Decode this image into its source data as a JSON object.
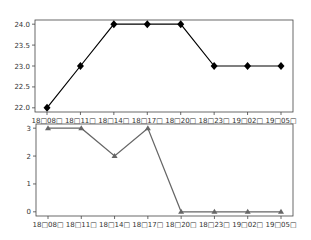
{
  "chart_data": [
    {
      "type": "line",
      "title": "",
      "xlabel": "",
      "ylabel": "",
      "categories": [
        "18□08□",
        "18□11□",
        "18□14□",
        "18□17□",
        "18□20□",
        "18□23□",
        "19□02□",
        "19□05□"
      ],
      "series": [
        {
          "name": "series-1",
          "values": [
            22,
            23,
            24,
            24,
            24,
            23,
            23,
            23
          ],
          "color": "#000000",
          "marker": "diamond"
        }
      ],
      "yticks": [
        "22.0",
        "22.5",
        "23.0",
        "23.5",
        "24.0"
      ],
      "ylim": [
        21.9,
        24.1
      ],
      "grid": false,
      "legend": null
    },
    {
      "type": "line",
      "title": "",
      "xlabel": "",
      "ylabel": "",
      "categories": [
        "18□08□",
        "18□11□",
        "18□14□",
        "18□17□",
        "18□20□",
        "18□23□",
        "19□02□",
        "19□05□"
      ],
      "series": [
        {
          "name": "series-2",
          "values": [
            3,
            3,
            2,
            3,
            0,
            0,
            0,
            0
          ],
          "color": "#666666",
          "marker": "triangle"
        }
      ],
      "yticks": [
        "0",
        "1",
        "2",
        "3"
      ],
      "ylim": [
        -0.15,
        3.15
      ],
      "grid": false,
      "legend": null
    }
  ]
}
